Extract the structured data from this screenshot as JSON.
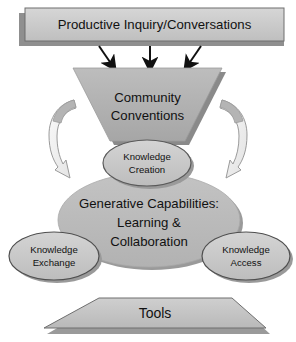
{
  "diagram": {
    "banner": {
      "label": "Productive Inquiry/Conversations",
      "fill": "#c6c6c6",
      "shadow": "#8f8f8f",
      "border": "#6e6e6e"
    },
    "arrows": {
      "count": 3,
      "color": "#111111",
      "direction": "down",
      "items": [
        {
          "name": "arrow-left",
          "label": ""
        },
        {
          "name": "arrow-middle",
          "label": ""
        },
        {
          "name": "arrow-right",
          "label": ""
        }
      ]
    },
    "funnel": {
      "label_line1": "Community",
      "label_line2": "Conventions",
      "fill": "#b0b0b0",
      "shadow": "#8a8a8a"
    },
    "curved_arrows": [
      {
        "name": "curved-arrow-left",
        "fill": "#f2f2f2",
        "stroke": "#8a8a8a"
      },
      {
        "name": "curved-arrow-right",
        "fill": "#f2f2f2",
        "stroke": "#8a8a8a"
      }
    ],
    "knowledge_creation": {
      "label_line1": "Knowledge",
      "label_line2": "Creation",
      "fill": "#cfcfcf",
      "stroke": "#5a5a5a"
    },
    "core": {
      "label_line1": "Generative Capabilities:",
      "label_line2": "Learning &",
      "label_line3": "Collaboration",
      "fill": "#bcbcbc",
      "shadow": "#9a9a9a"
    },
    "knowledge_exchange": {
      "label_line1": "Knowledge",
      "label_line2": "Exchange",
      "fill": "#c9c9c9",
      "stroke": "#4f4f4f",
      "shadow": "#9a9a9a"
    },
    "knowledge_access": {
      "label_line1": "Knowledge",
      "label_line2": "Access",
      "fill": "#c9c9c9",
      "stroke": "#4f4f4f",
      "shadow": "#9a9a9a"
    },
    "tools": {
      "label": "Tools",
      "fill": "#c4c4c4",
      "shadow": "#9a9a9a",
      "border": "#6e6e6e"
    }
  }
}
